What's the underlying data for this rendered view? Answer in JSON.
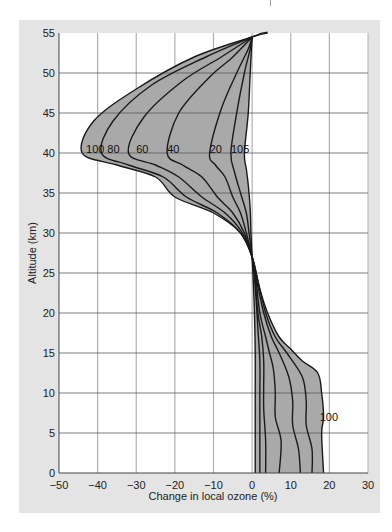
{
  "chart_data": {
    "type": "line",
    "title": "",
    "xlabel": "Change in local ozone (%)",
    "ylabel": "Altitude (km)",
    "xlim": [
      -50,
      30
    ],
    "ylim": [
      0,
      55
    ],
    "xticks": [
      -50,
      -40,
      -30,
      -20,
      -10,
      0,
      10,
      20,
      30
    ],
    "yticks": [
      0,
      5,
      10,
      15,
      20,
      25,
      30,
      35,
      40,
      45,
      50,
      55
    ],
    "grid": true,
    "shaded_envelope": "region between curve 5 and curve 100 shaded gray",
    "series": [
      {
        "name": "100",
        "points": [
          [
            18.5,
            0
          ],
          [
            18,
            5
          ],
          [
            18.5,
            7
          ],
          [
            18,
            10
          ],
          [
            17,
            12.5
          ],
          [
            13,
            14
          ],
          [
            10,
            15.5
          ],
          [
            7,
            17
          ],
          [
            4,
            20
          ],
          [
            2,
            23
          ],
          [
            0,
            27
          ],
          [
            -3,
            30
          ],
          [
            -10,
            32.5
          ],
          [
            -20,
            34.5
          ],
          [
            -25,
            37
          ],
          [
            -35,
            38.5
          ],
          [
            -44,
            40
          ],
          [
            -41,
            44
          ],
          [
            -30,
            48
          ],
          [
            -15,
            52
          ],
          [
            0,
            54.5
          ],
          [
            4,
            55
          ]
        ]
      },
      {
        "name": "80",
        "points": [
          [
            15.5,
            0
          ],
          [
            15.5,
            3
          ],
          [
            14,
            6
          ],
          [
            14,
            9
          ],
          [
            13,
            12
          ],
          [
            9,
            15
          ],
          [
            6,
            17
          ],
          [
            3.5,
            20
          ],
          [
            1.5,
            24
          ],
          [
            0,
            27
          ],
          [
            -3,
            30
          ],
          [
            -9,
            32.5
          ],
          [
            -17,
            34.5
          ],
          [
            -23,
            37
          ],
          [
            -32,
            38.5
          ],
          [
            -39,
            40
          ],
          [
            -36,
            44
          ],
          [
            -26,
            48.5
          ],
          [
            -12,
            52
          ],
          [
            0,
            54.5
          ]
        ]
      },
      {
        "name": "60",
        "points": [
          [
            12.5,
            0
          ],
          [
            12,
            3
          ],
          [
            10.5,
            6
          ],
          [
            10.5,
            9
          ],
          [
            9.5,
            12
          ],
          [
            7,
            15
          ],
          [
            5,
            17
          ],
          [
            3,
            20
          ],
          [
            1.2,
            24
          ],
          [
            0,
            27
          ],
          [
            -2.5,
            30
          ],
          [
            -7,
            32.5
          ],
          [
            -13,
            34.5
          ],
          [
            -19,
            37
          ],
          [
            -25,
            38.5
          ],
          [
            -32,
            40
          ],
          [
            -28,
            44.5
          ],
          [
            -18,
            49
          ],
          [
            -8,
            52
          ],
          [
            0,
            54.5
          ]
        ]
      },
      {
        "name": "40",
        "points": [
          [
            7,
            0
          ],
          [
            7.5,
            4
          ],
          [
            6,
            7
          ],
          [
            6,
            10
          ],
          [
            5.5,
            13
          ],
          [
            4.5,
            15
          ],
          [
            3.5,
            17
          ],
          [
            2,
            20
          ],
          [
            1,
            24
          ],
          [
            0,
            27
          ],
          [
            -2,
            30
          ],
          [
            -5,
            32.5
          ],
          [
            -9,
            34.5
          ],
          [
            -13,
            37
          ],
          [
            -18,
            38.5
          ],
          [
            -22,
            40
          ],
          [
            -19,
            45
          ],
          [
            -11,
            49.5
          ],
          [
            -5,
            52
          ],
          [
            0,
            54.5
          ]
        ]
      },
      {
        "name": "20",
        "points": [
          [
            3.5,
            0
          ],
          [
            3.5,
            4
          ],
          [
            3,
            8
          ],
          [
            3,
            11
          ],
          [
            3,
            14
          ],
          [
            2.5,
            17
          ],
          [
            1.5,
            20
          ],
          [
            0.8,
            24
          ],
          [
            0,
            27
          ],
          [
            -1.5,
            30
          ],
          [
            -3,
            32.5
          ],
          [
            -5,
            34.5
          ],
          [
            -7,
            37
          ],
          [
            -9.5,
            38.5
          ],
          [
            -11,
            40
          ],
          [
            -8,
            45.5
          ],
          [
            -4,
            50
          ],
          [
            -1,
            53
          ],
          [
            0,
            54.5
          ]
        ]
      },
      {
        "name": "10",
        "points": [
          [
            2,
            0
          ],
          [
            2,
            5
          ],
          [
            2,
            10
          ],
          [
            2,
            14
          ],
          [
            1.5,
            18
          ],
          [
            1,
            22
          ],
          [
            0.5,
            25
          ],
          [
            0,
            27
          ],
          [
            -0.8,
            30
          ],
          [
            -1.5,
            32.5
          ],
          [
            -3,
            35
          ],
          [
            -4.5,
            37.5
          ],
          [
            -5.5,
            40
          ],
          [
            -4,
            45
          ],
          [
            -2,
            50
          ],
          [
            -0.5,
            53
          ],
          [
            0,
            54.5
          ]
        ]
      },
      {
        "name": "5",
        "points": [
          [
            0.8,
            0
          ],
          [
            0.8,
            5
          ],
          [
            0.8,
            10
          ],
          [
            0.8,
            15
          ],
          [
            0.6,
            20
          ],
          [
            0.3,
            24
          ],
          [
            0,
            27
          ],
          [
            -0.3,
            30
          ],
          [
            -0.5,
            33
          ],
          [
            -1,
            36
          ],
          [
            -1.5,
            38
          ],
          [
            -2,
            40
          ],
          [
            -1,
            45
          ],
          [
            -0.5,
            50
          ],
          [
            0,
            54.5
          ]
        ]
      }
    ],
    "curve_labels": [
      {
        "text": "100",
        "x": -43,
        "y": 40.5
      },
      {
        "text": "80",
        "x": -37.5,
        "y": 40.5
      },
      {
        "text": "60",
        "x": -30,
        "y": 40.5
      },
      {
        "text": "40",
        "x": -22,
        "y": 40.5
      },
      {
        "text": "20",
        "x": -11,
        "y": 40.5
      },
      {
        "text": "10",
        "x": -5.5,
        "y": 40.5
      },
      {
        "text": "5",
        "x": -2.3,
        "y": 40.5
      },
      {
        "text": "100",
        "x": 17.5,
        "y": 7
      }
    ],
    "colors": {
      "frame": "#e4e4e4",
      "plot_bg": "#ffffff",
      "fill": "#a9a9a9",
      "curve": "#1a1a1a",
      "hgrid": "#555555",
      "vgrid": "#b0b0b0"
    }
  }
}
